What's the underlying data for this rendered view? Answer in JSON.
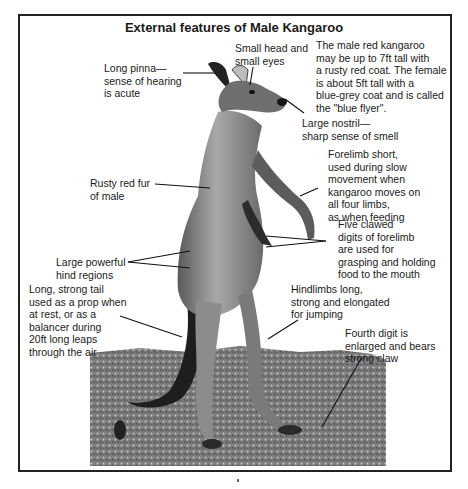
{
  "figure": {
    "title": "External features of Male Kangaroo",
    "description_note": "The male red kangaroo\nmay be up to 7ft tall with\na rusty red coat. The female\nis about 5ft tall with a\nblue-grey coat and is called\nthe \"blue flyer\".",
    "labels": [
      {
        "id": "pinna",
        "text": "Long pinna—\nsense of hearing\nis acute"
      },
      {
        "id": "head",
        "text": "Small head and\nsmall eyes"
      },
      {
        "id": "nostril",
        "text": "Large nostril—\nsharp sense of smell"
      },
      {
        "id": "forelimb",
        "text": "Forelimb short,\nused during slow\nmovement when\nkangaroo moves on\nall four limbs,\nas when feeding"
      },
      {
        "id": "fur",
        "text": "Rusty red fur\nof male"
      },
      {
        "id": "digits",
        "text": "Five clawed\ndigits of forelimb\nare used for\ngrasping and holding\nfood to the mouth"
      },
      {
        "id": "hind",
        "text": "Large powerful\nhind regions"
      },
      {
        "id": "tail",
        "text": "Long, strong tail\nused as a prop when\nat rest, or as a\nbalancer during\n20ft long leaps\nthrough the air"
      },
      {
        "id": "hindlimbs",
        "text": "Hindlimbs long,\nstrong and elongated\nfor jumping"
      },
      {
        "id": "fourth-digit",
        "text": "Fourth digit is\nenlarged and bears\nstrong claw"
      }
    ],
    "colors": {
      "ink": "#1a1a1a",
      "frame": "#222222",
      "ground": "#6e6e6e",
      "fur_dark": "#2a2a2a",
      "fur_mid": "#8a8a8a",
      "fur_light": "#c4c4c4"
    }
  }
}
